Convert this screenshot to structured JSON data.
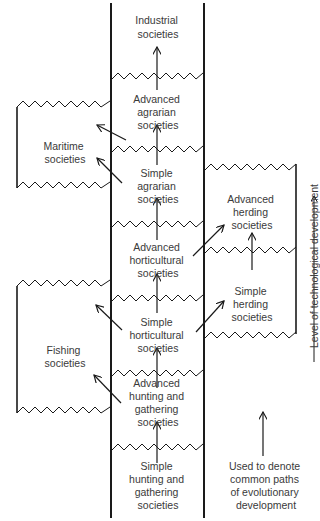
{
  "diagram": {
    "main_column": {
      "stages": [
        {
          "id": "industrial",
          "lines": [
            "Industrial",
            "societies"
          ]
        },
        {
          "id": "advanced-agrarian",
          "lines": [
            "Advanced",
            "agrarian",
            "societies"
          ]
        },
        {
          "id": "simple-agrarian",
          "lines": [
            "Simple",
            "agrarian",
            "societies"
          ]
        },
        {
          "id": "advanced-horticultural",
          "lines": [
            "Advanced",
            "horticultural",
            "societies"
          ]
        },
        {
          "id": "simple-horticultural",
          "lines": [
            "Simple",
            "horticultural",
            "societies"
          ]
        },
        {
          "id": "advanced-hunting-gathering",
          "lines": [
            "Advanced",
            "hunting and",
            "gathering",
            "societies"
          ]
        },
        {
          "id": "simple-hunting-gathering",
          "lines": [
            "Simple",
            "hunting and",
            "gathering",
            "societies"
          ]
        }
      ]
    },
    "side_branches": {
      "left": [
        {
          "id": "maritime",
          "lines": [
            "Maritime",
            "societies"
          ]
        },
        {
          "id": "fishing",
          "lines": [
            "Fishing",
            "societies"
          ]
        }
      ],
      "right": [
        {
          "id": "advanced-herding",
          "lines": [
            "Advanced",
            "herding",
            "societies"
          ]
        },
        {
          "id": "simple-herding",
          "lines": [
            "Simple",
            "herding",
            "societies"
          ]
        }
      ]
    },
    "axis_label": "Level of technological development",
    "legend": {
      "lines": [
        "Used to denote",
        "common paths",
        "of evolutionary",
        "development"
      ]
    },
    "colors": {
      "line": "#1a1a1a",
      "text": "#3a3a3a",
      "background": "#ffffff"
    }
  }
}
